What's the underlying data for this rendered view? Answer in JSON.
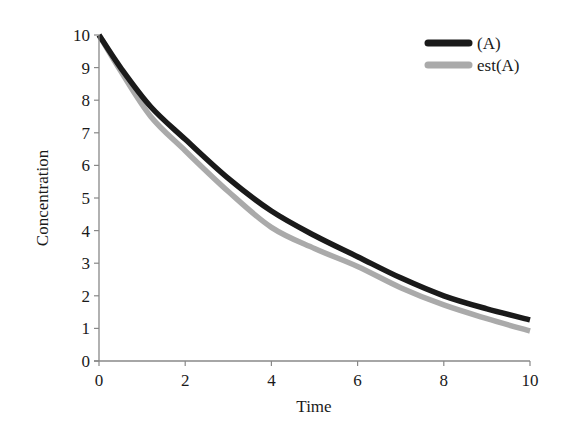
{
  "chart_data": {
    "type": "line",
    "title": "",
    "xlabel": "Time",
    "ylabel": "Concentration",
    "xlim": [
      0,
      10
    ],
    "ylim": [
      0,
      10
    ],
    "xticks": [
      0,
      2,
      4,
      6,
      8,
      10
    ],
    "yticks": [
      0,
      1,
      2,
      3,
      4,
      5,
      6,
      7,
      8,
      9,
      10
    ],
    "grid": false,
    "legend_position": "upper right",
    "series": [
      {
        "name": "(A)",
        "color": "#1a1a1a",
        "x": [
          0,
          0.5,
          1.2,
          2,
          3,
          4,
          5,
          6,
          7,
          8,
          9,
          10
        ],
        "y": [
          10,
          9.0,
          7.8,
          6.8,
          5.6,
          4.6,
          3.85,
          3.2,
          2.55,
          2.0,
          1.6,
          1.26
        ]
      },
      {
        "name": "est(A)",
        "color": "#aaaaaa",
        "x": [
          0,
          0.5,
          1.2,
          2,
          3,
          4,
          5,
          6,
          7,
          8,
          9,
          10
        ],
        "y": [
          10,
          8.9,
          7.5,
          6.45,
          5.2,
          4.1,
          3.45,
          2.9,
          2.25,
          1.72,
          1.3,
          0.92
        ]
      }
    ]
  }
}
